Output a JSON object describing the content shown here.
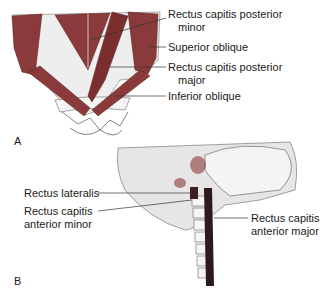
{
  "panel_a": {
    "letter": "A",
    "labels": {
      "rcp_minor_1": "Rectus capitis posterior",
      "rcp_minor_2": "minor",
      "superior_oblique": "Superior oblique",
      "rcp_major_1": "Rectus capitis posterior",
      "rcp_major_2": "major",
      "inferior_oblique": "Inferior oblique"
    }
  },
  "panel_b": {
    "letter": "B",
    "labels": {
      "rectus_lateralis": "Rectus lateralis",
      "rca_minor_1": "Rectus capitis",
      "rca_minor_2": "anterior minor",
      "rca_major_1": "Rectus capitis",
      "rca_major_2": "anterior major"
    }
  },
  "colors": {
    "muscle": "#8a3a3a",
    "bone": "#f2f2f2",
    "skull_shade": "#e0e0e0",
    "outline": "#444444"
  }
}
